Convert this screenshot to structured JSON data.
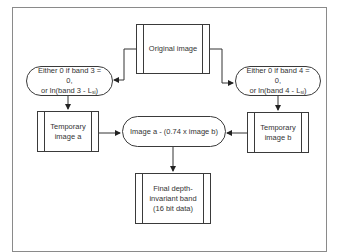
{
  "diagram": {
    "type": "flowchart",
    "nodes": {
      "original": {
        "label": "Original image",
        "shape": "predefined-process"
      },
      "cond_left": {
        "line1": "Either 0 if band 3 = 0,",
        "line2_prefix": "or ln(band 3 - L",
        "line2_sub": "si",
        "line2_suffix": ")",
        "shape": "terminator"
      },
      "cond_right": {
        "line1": "Either 0 if band 4 = 0,",
        "line2_prefix": "or ln(band 4 - L",
        "line2_sub": "si",
        "line2_suffix": ")",
        "shape": "terminator"
      },
      "temp_a": {
        "line1": "Temporary",
        "line2": "image a",
        "shape": "predefined-process"
      },
      "temp_b": {
        "line1": "Temporary",
        "line2": "image b",
        "shape": "predefined-process"
      },
      "combine": {
        "label": "Image a - (0.74 x image b)",
        "shape": "terminator"
      },
      "final": {
        "line1": "Final depth-",
        "line2": "invariant band",
        "line3": "(16 bit data)",
        "shape": "predefined-process"
      }
    },
    "edges": [
      {
        "from": "original",
        "to": "cond_left"
      },
      {
        "from": "original",
        "to": "cond_right"
      },
      {
        "from": "cond_left",
        "to": "temp_a"
      },
      {
        "from": "cond_right",
        "to": "temp_b"
      },
      {
        "from": "temp_a",
        "to": "combine"
      },
      {
        "from": "temp_b",
        "to": "combine"
      },
      {
        "from": "combine",
        "to": "final"
      }
    ],
    "colors": {
      "stroke": "#3a3a3a",
      "frame": "#8a8a8a",
      "text": "#333333",
      "background": "#ffffff"
    }
  }
}
